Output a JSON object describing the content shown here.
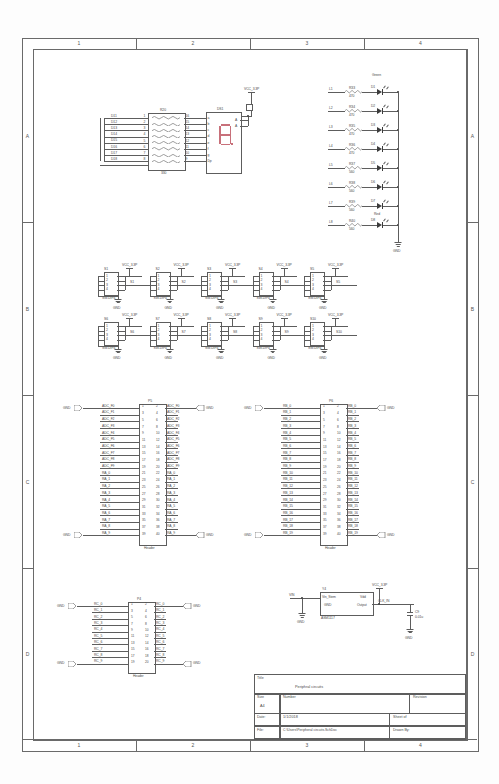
{
  "sheet": {
    "zones_top": [
      "1",
      "2",
      "3",
      "4"
    ],
    "zones_bottom": [
      "1",
      "2",
      "3",
      "4"
    ],
    "rows_left": [
      "A",
      "B",
      "C",
      "D"
    ],
    "rows_right": [
      "A",
      "B",
      "C",
      "D"
    ]
  },
  "title_block": {
    "title_label": "Title",
    "title_value": "Periphral circuits",
    "size_label": "Size",
    "size_value": "A4",
    "number_label": "Number",
    "number_value": "",
    "revision_label": "Revision",
    "revision_value": "",
    "date_label": "Date:",
    "date_value": "1/1/2018",
    "sheet_label": "Sheet   of",
    "sheet_value": "",
    "file_label": "File:",
    "file_value": "C:\\Users\\Peripheral circuits.SchDoc",
    "drawnby_label": "Drawn By:",
    "drawnby_value": ""
  },
  "seven_segment": {
    "net_labels": [
      "D11",
      "D12",
      "D13",
      "D14",
      "D15",
      "D16",
      "D17",
      "D18"
    ],
    "rnet_ref": "R20",
    "rnet_value": "330",
    "rnet_left_pins": [
      "1",
      "2",
      "3",
      "4",
      "5",
      "6",
      "7",
      "8"
    ],
    "rnet_right_pins": [
      "16",
      "15",
      "14",
      "13",
      "12",
      "11",
      "10",
      "9"
    ],
    "disp_ref": "DS1",
    "disp_pins": [
      "a",
      "b",
      "c",
      "d",
      "e",
      "f",
      "g",
      "Dp"
    ],
    "disp_right_pins": [
      "A",
      "A"
    ],
    "vcc_label": "VCC_3.3P"
  },
  "leds": {
    "top_label": "Green",
    "bottom_label": "Red",
    "gnd_label": "GND",
    "rows": [
      {
        "net": "L1",
        "ref": "R33",
        "value": "470",
        "led": "D1"
      },
      {
        "net": "L2",
        "ref": "R34",
        "value": "470",
        "led": "D2"
      },
      {
        "net": "L3",
        "ref": "R35",
        "value": "470",
        "led": "D3"
      },
      {
        "net": "L4",
        "ref": "R36",
        "value": "470",
        "led": "D4"
      },
      {
        "net": "L5",
        "ref": "R37",
        "value": "560",
        "led": "D5"
      },
      {
        "net": "L6",
        "ref": "R38",
        "value": "560",
        "led": "D6"
      },
      {
        "net": "L7",
        "ref": "R39",
        "value": "560",
        "led": "D7"
      },
      {
        "net": "L8",
        "ref": "R40",
        "value": "560",
        "led": "D8"
      }
    ]
  },
  "switches": {
    "vcc_label": "VCC_3.3P",
    "gnd_label": "GND",
    "part": "SW-DIP4",
    "pins": [
      "1",
      "2",
      "3",
      "4"
    ],
    "row1": [
      {
        "ref": "S1",
        "net": "S1"
      },
      {
        "ref": "S2",
        "net": "S2"
      },
      {
        "ref": "S3",
        "net": "S3"
      },
      {
        "ref": "S4",
        "net": "S4"
      },
      {
        "ref": "S5",
        "net": "S5"
      }
    ],
    "row2": [
      {
        "ref": "S6",
        "net": "S6"
      },
      {
        "ref": "S7",
        "net": "S7"
      },
      {
        "ref": "S8",
        "net": "S8"
      },
      {
        "ref": "S9",
        "net": "S9"
      },
      {
        "ref": "S10",
        "net": "S10"
      }
    ]
  },
  "header_p5": {
    "ref": "P5",
    "part": "Header",
    "gnd_label": "GND",
    "left_nets": [
      "ADC_F0",
      "ADC_F1",
      "ADC_F2",
      "ADC_F3",
      "ADC_F4",
      "ADC_F5",
      "ADC_F6",
      "ADC_F7",
      "ADC_F8",
      "ADC_F9",
      "RA_0",
      "RA_1",
      "RA_2",
      "RA_3",
      "RA_4",
      "RA_5",
      "RA_6",
      "RA_7",
      "RA_8",
      "RA_9"
    ],
    "right_nets": [
      "ADC_F0",
      "ADC_F1",
      "ADC_F2",
      "ADC_F3",
      "ADC_F4",
      "ADC_F5",
      "ADC_F6",
      "ADC_F7",
      "ADC_F8",
      "ADC_F9",
      "RA_0",
      "RA_1",
      "RA_2",
      "RA_3",
      "RA_4",
      "RA_5",
      "RA_6",
      "RA_7",
      "RA_8",
      "RA_9"
    ],
    "pin_count": 40
  },
  "header_p6": {
    "ref": "P6",
    "part": "Header",
    "gnd_label": "GND",
    "left_nets": [
      "RB_0",
      "RB_1",
      "RB_2",
      "RB_3",
      "RB_4",
      "RB_5",
      "RB_6",
      "RB_7",
      "RB_8",
      "RB_9",
      "RB_10",
      "RB_11",
      "RB_12",
      "RB_13",
      "RB_14",
      "RB_15",
      "RB_16",
      "RB_17",
      "RB_18",
      "RB_19"
    ],
    "right_nets": [
      "RB_0",
      "RB_1",
      "RB_2",
      "RB_3",
      "RB_4",
      "RB_5",
      "RB_6",
      "RB_7",
      "RB_8",
      "RB_9",
      "RB_10",
      "RB_11",
      "RB_12",
      "RB_13",
      "RB_14",
      "RB_15",
      "RB_16",
      "RB_17",
      "RB_18",
      "RB_19"
    ],
    "pin_count": 40
  },
  "header_p4": {
    "ref": "P4",
    "part": "Header",
    "gnd_label": "GND",
    "left_nets": [
      "RC_0",
      "RC_1",
      "RC_2",
      "RC_3",
      "RC_4",
      "RC_5",
      "RC_6",
      "RC_7",
      "RC_8",
      "RC_9"
    ],
    "right_nets": [
      "RC_0",
      "RC_1",
      "RC_2",
      "RC_3",
      "RC_4",
      "RC_5",
      "RC_6",
      "RC_7",
      "RC_8",
      "RC_9"
    ],
    "pin_count": 20
  },
  "regulator": {
    "ref": "Y4",
    "part": "ASM1117",
    "in_label": "Vin_Stem",
    "gnd_pin": "GND",
    "vout_label": "Vdd",
    "out_label": "Output",
    "in_net": "VIN",
    "vcc_label": "VCC_3.3P",
    "out_net": "CLK_IN",
    "cap_ref": "C9",
    "cap_value": "0.01u",
    "gnd_label": "GND"
  }
}
